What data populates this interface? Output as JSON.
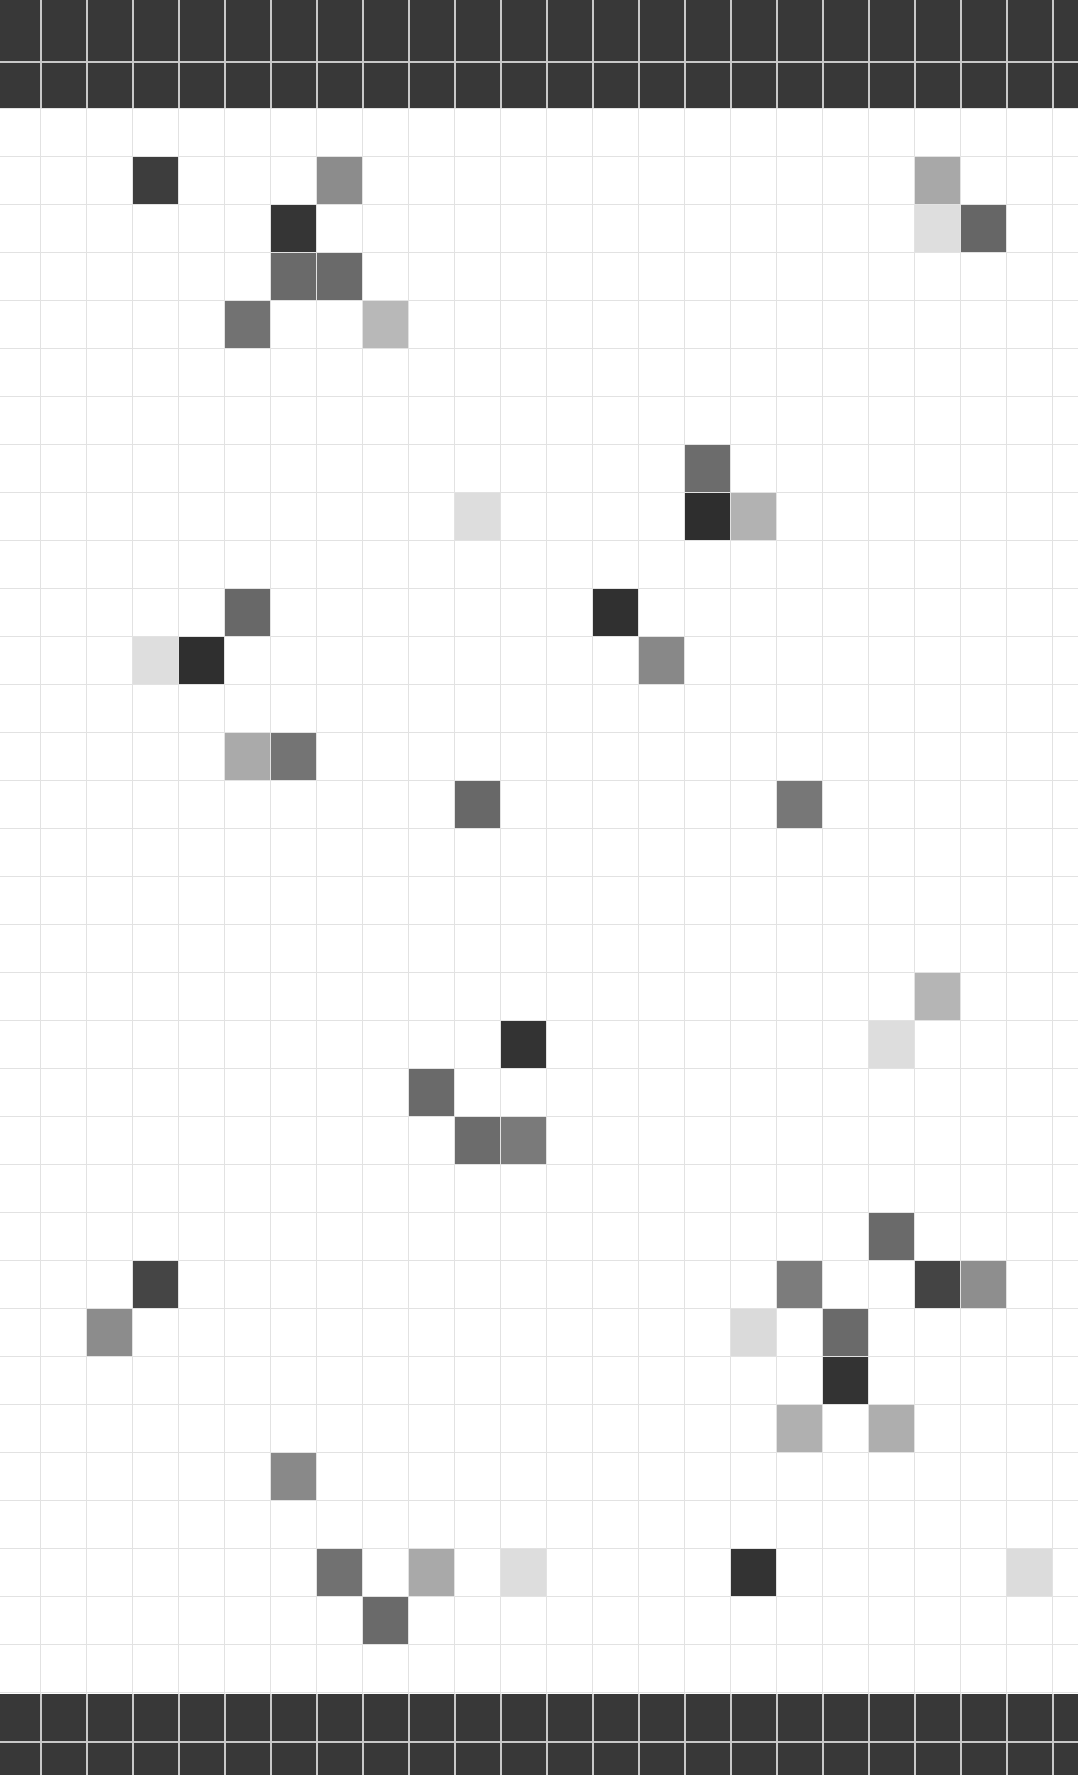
{
  "board": {
    "columns": 23,
    "rows": 33,
    "origin_x": 40,
    "col_width": 46,
    "row_height": 48,
    "grid_color": "#e2e2e2",
    "background": "#ffffff",
    "band_color": "#383838",
    "band_line_color": "#c8c8c8",
    "cells": [
      {
        "row": 1,
        "col": 3,
        "color": "#3d3d3d"
      },
      {
        "row": 1,
        "col": 7,
        "color": "#8c8c8c"
      },
      {
        "row": 1,
        "col": 20,
        "color": "#a8a8a8"
      },
      {
        "row": 2,
        "col": 6,
        "color": "#353535"
      },
      {
        "row": 2,
        "col": 20,
        "color": "#dedede"
      },
      {
        "row": 2,
        "col": 21,
        "color": "#666666"
      },
      {
        "row": 3,
        "col": 6,
        "color": "#6a6a6a"
      },
      {
        "row": 3,
        "col": 7,
        "color": "#6a6a6a"
      },
      {
        "row": 4,
        "col": 5,
        "color": "#727272"
      },
      {
        "row": 4,
        "col": 8,
        "color": "#b8b8b8"
      },
      {
        "row": 7,
        "col": 15,
        "color": "#6c6c6c"
      },
      {
        "row": 8,
        "col": 10,
        "color": "#dddddd"
      },
      {
        "row": 8,
        "col": 15,
        "color": "#2e2e2e"
      },
      {
        "row": 8,
        "col": 16,
        "color": "#b2b2b2"
      },
      {
        "row": 10,
        "col": 5,
        "color": "#686868"
      },
      {
        "row": 10,
        "col": 13,
        "color": "#303030"
      },
      {
        "row": 11,
        "col": 3,
        "color": "#dedede"
      },
      {
        "row": 11,
        "col": 4,
        "color": "#2f2f2f"
      },
      {
        "row": 11,
        "col": 14,
        "color": "#888888"
      },
      {
        "row": 13,
        "col": 5,
        "color": "#aaaaaa"
      },
      {
        "row": 13,
        "col": 6,
        "color": "#747474"
      },
      {
        "row": 14,
        "col": 10,
        "color": "#686868"
      },
      {
        "row": 14,
        "col": 17,
        "color": "#777777"
      },
      {
        "row": 18,
        "col": 20,
        "color": "#b5b5b5"
      },
      {
        "row": 19,
        "col": 11,
        "color": "#333333"
      },
      {
        "row": 19,
        "col": 19,
        "color": "#dddddd"
      },
      {
        "row": 20,
        "col": 9,
        "color": "#6a6a6a"
      },
      {
        "row": 21,
        "col": 10,
        "color": "#6c6c6c"
      },
      {
        "row": 21,
        "col": 11,
        "color": "#7a7a7a"
      },
      {
        "row": 23,
        "col": 19,
        "color": "#6a6a6a"
      },
      {
        "row": 24,
        "col": 3,
        "color": "#454545"
      },
      {
        "row": 24,
        "col": 17,
        "color": "#7c7c7c"
      },
      {
        "row": 24,
        "col": 20,
        "color": "#444444"
      },
      {
        "row": 24,
        "col": 21,
        "color": "#8e8e8e"
      },
      {
        "row": 25,
        "col": 2,
        "color": "#8c8c8c"
      },
      {
        "row": 25,
        "col": 16,
        "color": "#dadada"
      },
      {
        "row": 25,
        "col": 18,
        "color": "#6a6a6a"
      },
      {
        "row": 26,
        "col": 18,
        "color": "#333333"
      },
      {
        "row": 27,
        "col": 17,
        "color": "#b0b0b0"
      },
      {
        "row": 27,
        "col": 19,
        "color": "#aeaeae"
      },
      {
        "row": 28,
        "col": 6,
        "color": "#898989"
      },
      {
        "row": 30,
        "col": 7,
        "color": "#717171"
      },
      {
        "row": 30,
        "col": 9,
        "color": "#a9a9a9"
      },
      {
        "row": 30,
        "col": 11,
        "color": "#dddddd"
      },
      {
        "row": 30,
        "col": 16,
        "color": "#333333"
      },
      {
        "row": 30,
        "col": 22,
        "color": "#dcdcdc"
      },
      {
        "row": 31,
        "col": 8,
        "color": "#6a6a6a"
      }
    ]
  }
}
